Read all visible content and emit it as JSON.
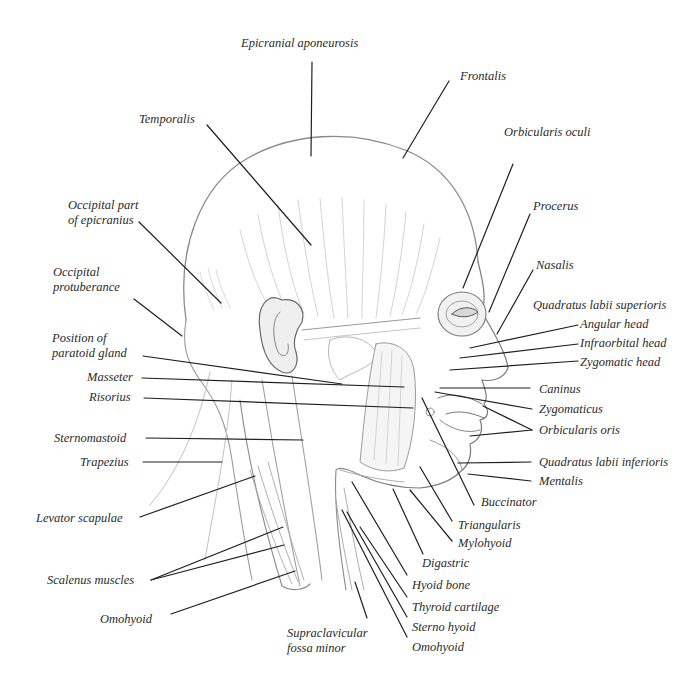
{
  "diagram": {
    "labels": [
      {
        "id": "epicranial-aponeurosis",
        "text": "Epicranial aponeurosis",
        "x": 241,
        "y": 36
      },
      {
        "id": "frontalis",
        "text": "Frontalis",
        "x": 460,
        "y": 69
      },
      {
        "id": "temporalis",
        "text": "Temporalis",
        "x": 139,
        "y": 112
      },
      {
        "id": "orbicularis-oculi",
        "text": "Orbicularis oculi",
        "x": 504,
        "y": 125
      },
      {
        "id": "occipital-part-of-epicranius",
        "text": "Occipital part of epicranius",
        "x": 68,
        "y": 198,
        "width": 82
      },
      {
        "id": "procerus",
        "text": "Procerus",
        "x": 533,
        "y": 199
      },
      {
        "id": "occipital-protuberance",
        "text": "Occipital protuberance",
        "x": 53,
        "y": 265,
        "width": 80
      },
      {
        "id": "nasalis",
        "text": "Nasalis",
        "x": 536,
        "y": 258
      },
      {
        "id": "quadratus-labii-superioris",
        "text": "Quadratus labii superioris",
        "x": 533,
        "y": 298
      },
      {
        "id": "angular-head",
        "text": "Angular head",
        "x": 580,
        "y": 317
      },
      {
        "id": "infraorbital-head",
        "text": "Infraorbital head",
        "x": 580,
        "y": 336
      },
      {
        "id": "position-of-paratoid-gland",
        "text": "Position of paratoid gland",
        "x": 52,
        "y": 331,
        "width": 100
      },
      {
        "id": "zygomatic-head",
        "text": "Zygomatic head",
        "x": 580,
        "y": 355
      },
      {
        "id": "masseter",
        "text": "Masseter",
        "x": 87,
        "y": 370
      },
      {
        "id": "caninus",
        "text": "Caninus",
        "x": 539,
        "y": 382
      },
      {
        "id": "risorius",
        "text": "Risorius",
        "x": 89,
        "y": 390
      },
      {
        "id": "zygomaticus",
        "text": "Zygomaticus",
        "x": 539,
        "y": 402
      },
      {
        "id": "orbicularis-oris",
        "text": "Orbicularis oris",
        "x": 539,
        "y": 423
      },
      {
        "id": "sternomastoid",
        "text": "Sternomastoid",
        "x": 54,
        "y": 431
      },
      {
        "id": "trapezius",
        "text": "Trapezius",
        "x": 80,
        "y": 455
      },
      {
        "id": "quadratus-labii-inferioris",
        "text": "Quadratus labii inferioris",
        "x": 539,
        "y": 455
      },
      {
        "id": "mentalis",
        "text": "Mentalis",
        "x": 539,
        "y": 474
      },
      {
        "id": "buccinator",
        "text": "Buccinator",
        "x": 481,
        "y": 495
      },
      {
        "id": "levator-scapulae",
        "text": "Levator scapulae",
        "x": 36,
        "y": 511
      },
      {
        "id": "triangularis",
        "text": "Triangularis",
        "x": 458,
        "y": 518
      },
      {
        "id": "mylohyoid",
        "text": "Mylohyoid",
        "x": 458,
        "y": 536
      },
      {
        "id": "digastric",
        "text": "Digastric",
        "x": 422,
        "y": 556
      },
      {
        "id": "scalenus-muscles",
        "text": "Scalenus muscles",
        "x": 47,
        "y": 573
      },
      {
        "id": "hyoid-bone",
        "text": "Hyoid bone",
        "x": 412,
        "y": 578
      },
      {
        "id": "thyroid-cartilage",
        "text": "Thyroid cartilage",
        "x": 412,
        "y": 600
      },
      {
        "id": "omohyoid-left",
        "text": "Omohyoid",
        "x": 100,
        "y": 612
      },
      {
        "id": "sterno-hyoid",
        "text": "Sterno hyoid",
        "x": 412,
        "y": 620
      },
      {
        "id": "supraclavicular-fossa-minor",
        "text": "Supraclavicular fossa minor",
        "x": 287,
        "y": 626,
        "width": 90
      },
      {
        "id": "omohyoid-right",
        "text": "Omohyoid",
        "x": 412,
        "y": 640
      }
    ],
    "leaders": [
      {
        "for": "epicranial-aponeurosis",
        "x1": 312,
        "y1": 62,
        "x2": 311,
        "y2": 156
      },
      {
        "for": "frontalis",
        "x1": 449,
        "y1": 81,
        "x2": 403,
        "y2": 158
      },
      {
        "for": "temporalis",
        "x1": 207,
        "y1": 125,
        "x2": 311,
        "y2": 245
      },
      {
        "for": "orbicularis-oculi",
        "x1": 513,
        "y1": 164,
        "x2": 463,
        "y2": 288
      },
      {
        "for": "occipital-part-of-epicranius",
        "x1": 139,
        "y1": 222,
        "x2": 221,
        "y2": 303
      },
      {
        "for": "procerus",
        "x1": 530,
        "y1": 214,
        "x2": 489,
        "y2": 312
      },
      {
        "for": "occipital-protuberance",
        "x1": 134,
        "y1": 299,
        "x2": 182,
        "y2": 336
      },
      {
        "for": "nasalis",
        "x1": 533,
        "y1": 270,
        "x2": 497,
        "y2": 334
      },
      {
        "for": "angular-head",
        "x1": 578,
        "y1": 325,
        "x2": 470,
        "y2": 348
      },
      {
        "for": "infraorbital-head",
        "x1": 578,
        "y1": 344,
        "x2": 460,
        "y2": 358
      },
      {
        "for": "zygomatic-head",
        "x1": 578,
        "y1": 361,
        "x2": 450,
        "y2": 370
      },
      {
        "for": "position-of-paratoid-gland",
        "x1": 143,
        "y1": 356,
        "x2": 342,
        "y2": 384
      },
      {
        "for": "masseter",
        "x1": 142,
        "y1": 378,
        "x2": 404,
        "y2": 387
      },
      {
        "for": "caninus",
        "x1": 530,
        "y1": 388,
        "x2": 440,
        "y2": 388
      },
      {
        "for": "risorius",
        "x1": 144,
        "y1": 398,
        "x2": 413,
        "y2": 408
      },
      {
        "for": "zygomaticus",
        "x1": 532,
        "y1": 409,
        "x2": 435,
        "y2": 392
      },
      {
        "for": "orbicularis-oris-a",
        "x1": 532,
        "y1": 430,
        "x2": 483,
        "y2": 406
      },
      {
        "for": "orbicularis-oris-b",
        "x1": 532,
        "y1": 430,
        "x2": 470,
        "y2": 436
      },
      {
        "for": "sternomastoid",
        "x1": 146,
        "y1": 438,
        "x2": 303,
        "y2": 440
      },
      {
        "for": "trapezius",
        "x1": 143,
        "y1": 462,
        "x2": 222,
        "y2": 462
      },
      {
        "for": "quadratus-labii-inferioris",
        "x1": 531,
        "y1": 462,
        "x2": 458,
        "y2": 463
      },
      {
        "for": "mentalis",
        "x1": 531,
        "y1": 481,
        "x2": 468,
        "y2": 474
      },
      {
        "for": "buccinator",
        "x1": 474,
        "y1": 505,
        "x2": 422,
        "y2": 398
      },
      {
        "for": "levator-scapulae",
        "x1": 140,
        "y1": 517,
        "x2": 255,
        "y2": 476
      },
      {
        "for": "triangularis",
        "x1": 452,
        "y1": 521,
        "x2": 420,
        "y2": 467
      },
      {
        "for": "mylohyoid",
        "x1": 452,
        "y1": 541,
        "x2": 410,
        "y2": 490
      },
      {
        "for": "digastric",
        "x1": 423,
        "y1": 554,
        "x2": 393,
        "y2": 489
      },
      {
        "for": "scalenus-muscles-a",
        "x1": 151,
        "y1": 580,
        "x2": 283,
        "y2": 527
      },
      {
        "for": "scalenus-muscles-b",
        "x1": 151,
        "y1": 580,
        "x2": 284,
        "y2": 545
      },
      {
        "for": "omohyoid-left",
        "x1": 171,
        "y1": 614,
        "x2": 295,
        "y2": 571
      },
      {
        "for": "hyoid-bone",
        "x1": 407,
        "y1": 575,
        "x2": 352,
        "y2": 482
      },
      {
        "for": "thyroid-cartilage",
        "x1": 407,
        "y1": 597,
        "x2": 360,
        "y2": 527
      },
      {
        "for": "sterno-hyoid",
        "x1": 407,
        "y1": 617,
        "x2": 347,
        "y2": 512
      },
      {
        "for": "supraclavicular-fossa-minor",
        "x1": 367,
        "y1": 618,
        "x2": 355,
        "y2": 582
      },
      {
        "for": "omohyoid-right",
        "x1": 407,
        "y1": 637,
        "x2": 342,
        "y2": 510
      }
    ],
    "colors": {
      "background": "#ffffff",
      "label_text": "#2a2a2a",
      "leader_line": "#1f1f1f",
      "sketch_dark": "#6e6e6e",
      "sketch_light": "#b5b5b5"
    }
  }
}
